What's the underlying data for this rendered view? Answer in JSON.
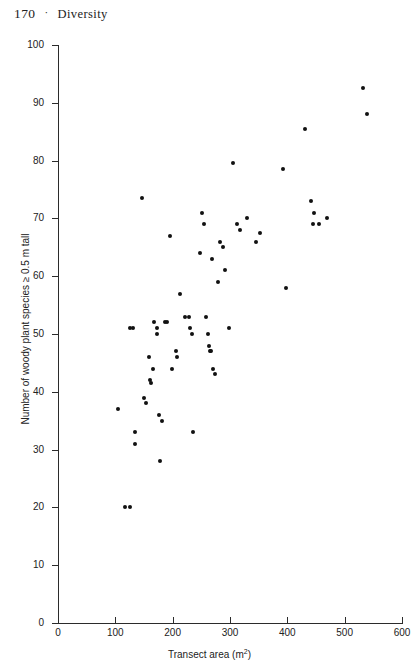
{
  "running_head": {
    "page_number": "170",
    "separator": "·",
    "title": "Diversity"
  },
  "chart_data": {
    "type": "scatter",
    "title": "",
    "xlabel": "Transect area (m²)",
    "ylabel": "Number of woody plant species ≥ 0.5 m tall",
    "xlim": [
      0,
      600
    ],
    "ylim": [
      0,
      100
    ],
    "xticks": [
      0,
      100,
      200,
      300,
      400,
      500,
      600
    ],
    "yticks": [
      0,
      10,
      20,
      30,
      40,
      50,
      60,
      70,
      80,
      90,
      100
    ],
    "grid": false,
    "legend": null,
    "marker": "filled-circle",
    "marker_color": "#111111",
    "points": [
      [
        104,
        37
      ],
      [
        117,
        20
      ],
      [
        125,
        20
      ],
      [
        126,
        51
      ],
      [
        131,
        51
      ],
      [
        134,
        33
      ],
      [
        135,
        31
      ],
      [
        146,
        73.5
      ],
      [
        150,
        39
      ],
      [
        153,
        38
      ],
      [
        158,
        46
      ],
      [
        160,
        42
      ],
      [
        162,
        41.5
      ],
      [
        165,
        44
      ],
      [
        168,
        52
      ],
      [
        172,
        51
      ],
      [
        173,
        50
      ],
      [
        176,
        36
      ],
      [
        178,
        28
      ],
      [
        182,
        35
      ],
      [
        186,
        52
      ],
      [
        190,
        52
      ],
      [
        196,
        67
      ],
      [
        199,
        44
      ],
      [
        205,
        47
      ],
      [
        207,
        46
      ],
      [
        213,
        57
      ],
      [
        222,
        53
      ],
      [
        228,
        53
      ],
      [
        231,
        51
      ],
      [
        234,
        50
      ],
      [
        236,
        33
      ],
      [
        247,
        64
      ],
      [
        252,
        71
      ],
      [
        254,
        69
      ],
      [
        258,
        53
      ],
      [
        261,
        50
      ],
      [
        263,
        48
      ],
      [
        265,
        47
      ],
      [
        266,
        47
      ],
      [
        268,
        63
      ],
      [
        271,
        44
      ],
      [
        274,
        43
      ],
      [
        279,
        59
      ],
      [
        282,
        66
      ],
      [
        287,
        65
      ],
      [
        291,
        61
      ],
      [
        298,
        51
      ],
      [
        305,
        79.5
      ],
      [
        312,
        69
      ],
      [
        318,
        68
      ],
      [
        330,
        70
      ],
      [
        346,
        66
      ],
      [
        352,
        67.5
      ],
      [
        392,
        78.5
      ],
      [
        398,
        58
      ],
      [
        430,
        85.5
      ],
      [
        441,
        73
      ],
      [
        444,
        69
      ],
      [
        447,
        71
      ],
      [
        456,
        69
      ],
      [
        470,
        70
      ],
      [
        532,
        92.5
      ],
      [
        539,
        88
      ]
    ]
  }
}
